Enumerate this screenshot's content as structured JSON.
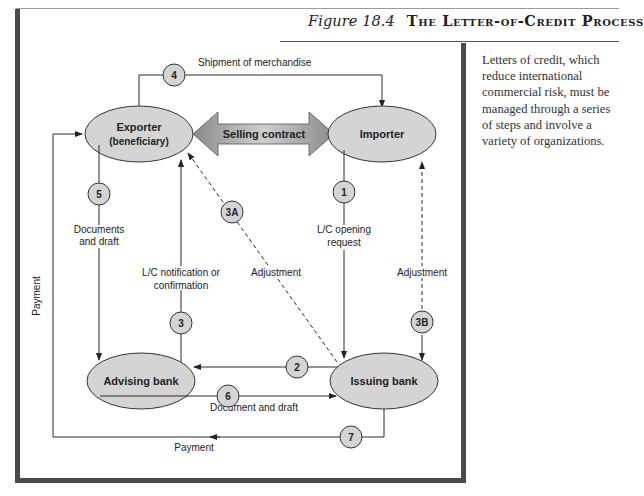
{
  "figure": {
    "number": "Figure 18.4",
    "title": "The Letter-of-Credit Process"
  },
  "caption": "Letters of credit, which reduce international commercial risk, must be managed through a series of steps and involve a variety of organizations.",
  "nodes": {
    "exporter": {
      "line1": "Exporter",
      "line2": "(beneficiary)"
    },
    "importer": {
      "label": "Importer"
    },
    "advising_bank": {
      "label": "Advising bank"
    },
    "issuing_bank": {
      "label": "Issuing bank"
    }
  },
  "selling_contract": "Selling contract",
  "steps": {
    "s1": "1",
    "s2": "2",
    "s3": "3",
    "s3a": "3A",
    "s3b": "3B",
    "s4": "4",
    "s5": "5",
    "s6": "6",
    "s7": "7"
  },
  "edge_labels": {
    "shipment": "Shipment of merchandise",
    "documents_draft_1": "Documents",
    "documents_draft_2": "and draft",
    "lc_notification_1": "L/C notification or",
    "lc_notification_2": "confirmation",
    "adjustment_left": "Adjustment",
    "lc_opening_1": "L/C opening",
    "lc_opening_2": "request",
    "adjustment_right": "Adjustment",
    "payment_left": "Payment",
    "document_and_draft": "Document and draft",
    "payment_bottom": "Payment"
  },
  "colors": {
    "node_fill": "#d4d4d4",
    "line": "#2a2a2a",
    "frame": "#4a4a4a"
  }
}
